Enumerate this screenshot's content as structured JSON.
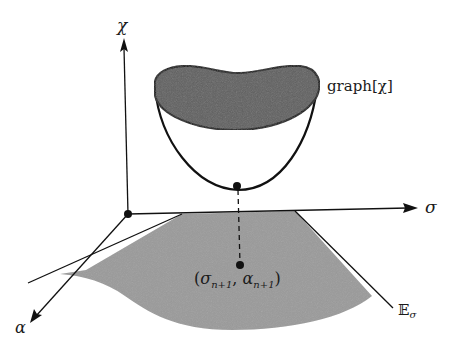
{
  "figure": {
    "colors": {
      "ink": "#111111",
      "surface_fill": "#9a9a9a",
      "cap_fill": "#5e5e5e",
      "background": "#ffffff"
    },
    "axes": {
      "vertical_label": "χ",
      "horizontal_label": "σ",
      "depth_label": "α"
    },
    "labels": {
      "graph_label": "graph[χ]",
      "point_label_open": "(",
      "point_sigma": "σ",
      "point_sigma_sub": "n+1",
      "point_sep": ", ",
      "point_alpha": "α",
      "point_alpha_sub": "n+1",
      "point_label_close": ")",
      "surface_label_symbol": "𝔼",
      "surface_label_sub": "σ"
    }
  }
}
